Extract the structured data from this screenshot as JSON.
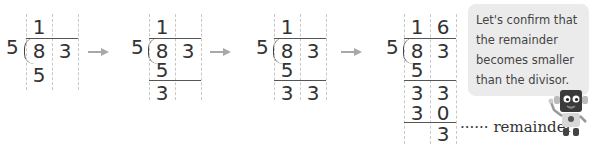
{
  "steps": [
    {
      "divisor": "5",
      "quotient": [
        "1",
        ""
      ],
      "dividend": [
        "8",
        "3"
      ],
      "rows": [
        [
          "5",
          ""
        ]
      ]
    },
    {
      "divisor": "5",
      "quotient": [
        "1",
        ""
      ],
      "dividend": [
        "8",
        "3"
      ],
      "rows": [
        [
          "5",
          ""
        ],
        [
          "3",
          ""
        ]
      ]
    },
    {
      "divisor": "5",
      "quotient": [
        "1",
        ""
      ],
      "dividend": [
        "8",
        "3"
      ],
      "rows": [
        [
          "5",
          ""
        ],
        [
          "3",
          "3"
        ]
      ]
    },
    {
      "divisor": "5",
      "quotient": [
        "1",
        "6"
      ],
      "dividend": [
        "8",
        "3"
      ],
      "rows": [
        [
          "5",
          ""
        ],
        [
          "3",
          "3"
        ],
        [
          "3",
          "0"
        ],
        [
          "",
          "3"
        ]
      ]
    }
  ],
  "arrows": [
    "arrow-right-icon",
    "arrow-right-icon",
    "arrow-right-icon"
  ],
  "remainder_label": "······ remainder",
  "callout": {
    "text": "Let's confirm that the remainder becomes smaller than the divisor.",
    "mascot": "robot-mascot-icon"
  },
  "colors": {
    "arrow": "#a8a8a8",
    "bubble_bg": "#ebebeb",
    "grid_dashed": "#c8c8c8",
    "text": "#333333"
  }
}
